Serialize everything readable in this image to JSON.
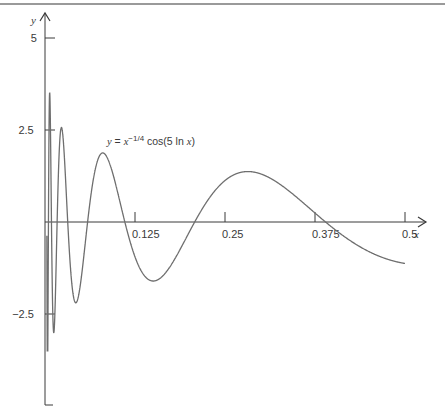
{
  "chart_data": {
    "type": "line",
    "title": "",
    "annotation": {
      "y_var": "y",
      "eq": " = ",
      "x_var": "x",
      "exponent": "−1/4",
      "func_prefix": " cos(5 ln ",
      "func_suffix": ")",
      "plain": "y = x^(-1/4) cos(5 ln x)"
    },
    "xlabel": "x",
    "ylabel": "y",
    "xlim": [
      0,
      0.5
    ],
    "ylim": [
      -5,
      5
    ],
    "x_ticks": [
      0.125,
      0.25,
      0.375,
      0.5
    ],
    "x_tick_labels": [
      "0.125",
      "0.25",
      "0.375",
      "0.5"
    ],
    "y_ticks": [
      5,
      2.5,
      -2.5
    ],
    "y_tick_labels": [
      "5",
      "2.5",
      "−2.5"
    ],
    "grid": false,
    "legend": "none",
    "series": [
      {
        "name": "y = x^(-1/4) cos(5 ln x)",
        "function": "x^(-1/4)*cos(5*ln(x))",
        "x_range": [
          0.0026,
          0.5
        ],
        "samples": [
          {
            "x": 0.0079,
            "y": 3.45
          },
          {
            "x": 0.0167,
            "y": 2.75
          },
          {
            "x": 0.0792,
            "y": 1.87
          },
          {
            "x": 0.151,
            "y": -1.6
          },
          {
            "x": 0.2,
            "y": 0.0
          },
          {
            "x": 0.287,
            "y": 1.36
          },
          {
            "x": 0.376,
            "y": 0.0
          },
          {
            "x": 0.5,
            "y": -1.13
          }
        ]
      }
    ]
  },
  "colors": {
    "axis": "#3a3a3a",
    "curve": "#6e6e6e",
    "topline": "#9a9a9a"
  }
}
